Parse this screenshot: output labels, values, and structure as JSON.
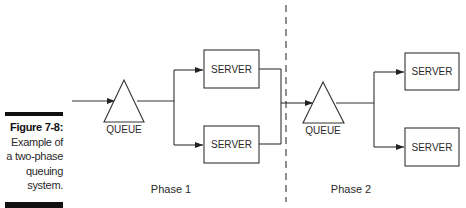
{
  "caption": {
    "figure_label": "Figure 7-8:",
    "lines": [
      "Example of",
      "a two-phase",
      "queuing",
      "system."
    ]
  },
  "diagram": {
    "title": "Two-phase queuing system",
    "phases": [
      {
        "label": "Phase 1",
        "queue_label": "QUEUE",
        "servers": [
          "SERVER",
          "SERVER"
        ]
      },
      {
        "label": "Phase 2",
        "queue_label": "QUEUE",
        "servers": [
          "SERVER",
          "SERVER"
        ]
      }
    ],
    "colors": {
      "stroke": "#333333",
      "text": "#2a2a2a",
      "divider": "#333333"
    }
  }
}
